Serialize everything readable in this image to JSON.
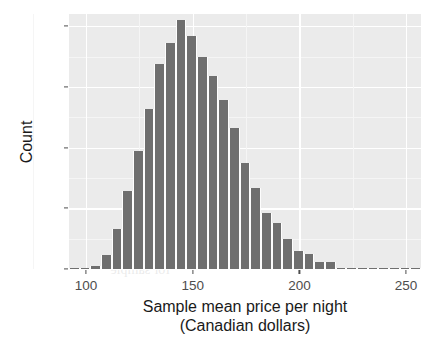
{
  "figure": {
    "kind": "histogram-figure",
    "panel_background": "#ebebeb",
    "gridline_color": "#ffffff",
    "bar_color": "#6f6f6f",
    "text_color": "#1a1a1a",
    "tick_color": "#4d4d4d"
  },
  "axis": {
    "y_title": "Count",
    "x_title_line1": "Sample mean price per night",
    "x_title_line2": "(Canadian dollars)",
    "y_ticks": [
      "0",
      "500",
      "1000",
      "1500",
      "2000"
    ],
    "x_ticks": [
      "100",
      "150",
      "200",
      "250"
    ]
  },
  "ghost_text": [
    "Sample mean price per night",
    "(Canadian dollars)",
    "Figure 10.14  A histogram of the sampling distribution",
    "of the sample mean for sample size",
    "A depiction of the sampling",
    "of sample",
    "distribution",
    "for sample"
  ],
  "chart_data": {
    "type": "bar",
    "subtype": "histogram",
    "title": "",
    "xlabel": "Sample mean price per night (Canadian dollars)",
    "ylabel": "Count",
    "xlim": [
      92,
      257
    ],
    "ylim": [
      0,
      2100
    ],
    "grid": true,
    "legend": "none",
    "bin_width": 5,
    "x_tick_values": [
      100,
      150,
      200,
      250
    ],
    "y_tick_values": [
      0,
      500,
      1000,
      1500,
      2000
    ],
    "bin_starts": [
      92,
      97,
      102,
      107,
      112,
      117,
      122,
      127,
      132,
      137,
      142,
      147,
      152,
      157,
      162,
      167,
      172,
      177,
      182,
      187,
      192,
      197,
      202,
      207,
      212,
      217,
      222,
      227,
      232,
      237,
      242,
      247,
      252
    ],
    "bin_centers": [
      94.5,
      99.5,
      104.5,
      109.5,
      114.5,
      119.5,
      124.5,
      129.5,
      134.5,
      139.5,
      144.5,
      149.5,
      154.5,
      159.5,
      164.5,
      169.5,
      174.5,
      179.5,
      184.5,
      189.5,
      194.5,
      199.5,
      204.5,
      209.5,
      214.5,
      219.5,
      224.5,
      229.5,
      234.5,
      239.5,
      244.5,
      249.5,
      254.5
    ],
    "categories": [
      "92-97",
      "97-102",
      "102-107",
      "107-112",
      "112-117",
      "117-122",
      "122-127",
      "127-132",
      "132-137",
      "137-142",
      "142-147",
      "147-152",
      "152-157",
      "157-162",
      "162-167",
      "167-172",
      "172-177",
      "177-182",
      "182-187",
      "187-192",
      "192-197",
      "197-202",
      "202-207",
      "207-212",
      "212-217",
      "217-222",
      "222-227",
      "227-232",
      "232-237",
      "237-242",
      "242-247",
      "247-252",
      "252-257"
    ],
    "values": [
      2,
      4,
      25,
      115,
      330,
      645,
      975,
      1320,
      1690,
      1865,
      2050,
      1920,
      1750,
      1590,
      1390,
      1160,
      875,
      670,
      465,
      375,
      245,
      150,
      120,
      60,
      60,
      12,
      12,
      4,
      3,
      2,
      1,
      1,
      1
    ]
  }
}
